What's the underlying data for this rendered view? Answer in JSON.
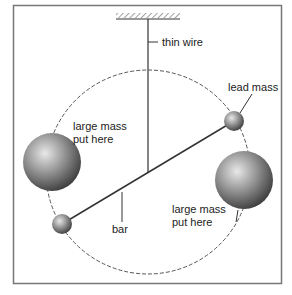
{
  "diagram": {
    "type": "torsion-balance",
    "labels": {
      "wire": "thin wire",
      "lead_mass": "lead mass",
      "large_mass_left_line1": "large mass",
      "large_mass_left_line2": "put here",
      "large_mass_right_line1": "large mass",
      "large_mass_right_line2": "put here",
      "bar": "bar"
    },
    "colors": {
      "frame": "#777777",
      "line": "#333333",
      "dashed_circle": "#555555"
    }
  }
}
